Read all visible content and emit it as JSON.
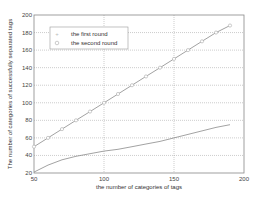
{
  "chart_data": {
    "type": "line",
    "title": "",
    "xlabel": "the number of categories of tags",
    "ylabel": "The number of categories of successfully separated tags",
    "xlim": [
      50,
      200
    ],
    "ylim": [
      20,
      200
    ],
    "xticks": [
      50,
      100,
      150,
      200
    ],
    "yticks": [
      20,
      40,
      60,
      80,
      100,
      120,
      140,
      160,
      180,
      200
    ],
    "grid": true,
    "legend_position": "upper left",
    "x": [
      50,
      60,
      70,
      80,
      90,
      100,
      110,
      120,
      130,
      140,
      150,
      160,
      170,
      180,
      190
    ],
    "series": [
      {
        "name": "the first round",
        "marker": "+",
        "values": [
          50,
          60,
          70,
          80,
          90,
          100,
          110,
          120,
          130,
          140,
          150,
          160,
          170,
          180,
          188
        ]
      },
      {
        "name": "the second round",
        "marker": "o",
        "values": [
          21,
          29,
          35,
          39,
          42,
          45,
          47,
          50,
          53,
          56,
          60,
          64,
          68,
          72,
          75
        ]
      }
    ]
  },
  "legend": {
    "items": [
      {
        "label": "the first round",
        "marker": "+"
      },
      {
        "label": "the second round",
        "marker": "o"
      }
    ]
  },
  "colors": {
    "line": "#8a8a8a",
    "grid": "#9a9a9a",
    "axis": "#777777",
    "marker": "#aaaaaa"
  }
}
